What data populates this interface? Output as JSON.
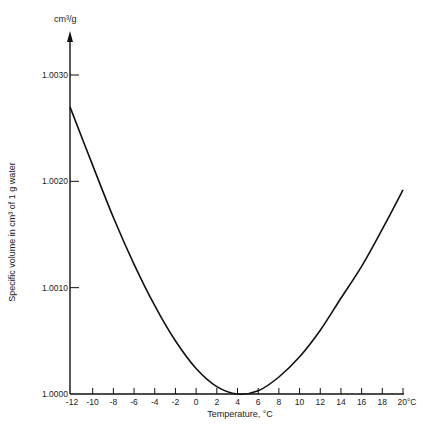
{
  "chart_data": {
    "type": "line",
    "title": "",
    "xlabel": "Temperature, °C",
    "ylabel": "Specific volume in cm³ of 1 g water",
    "y_unit_label": "cm³/g",
    "xlim": [
      -12,
      20
    ],
    "ylim": [
      1.0,
      1.0032
    ],
    "grid": false,
    "legend": null,
    "x_ticks": [
      -12,
      -10,
      -8,
      -6,
      -4,
      -2,
      0,
      2,
      4,
      6,
      8,
      10,
      12,
      14,
      16,
      18,
      20
    ],
    "x_tick_labels": [
      "-12",
      "-10",
      "-8",
      "-6",
      "-4",
      "-2",
      "0",
      "2",
      "4",
      "6",
      "8",
      "10",
      "12",
      "14",
      "16",
      "18",
      "20°C"
    ],
    "y_ticks": [
      1.0,
      1.001,
      1.002,
      1.003
    ],
    "y_tick_labels": [
      "1.0000",
      "1.0010",
      "1.0020",
      "1.0030"
    ],
    "series": [
      {
        "name": "Specific volume of water",
        "x": [
          -12,
          -10,
          -8,
          -6,
          -4,
          -2,
          0,
          2,
          4,
          6,
          8,
          10,
          12,
          14,
          16,
          18,
          20
        ],
        "y": [
          1.0027,
          1.00215,
          1.00166,
          1.00122,
          1.00083,
          1.0005,
          1.00024,
          1.00007,
          1.0,
          1.00003,
          1.00016,
          1.00035,
          1.0006,
          1.0009,
          1.0012,
          1.00155,
          1.00192
        ]
      }
    ]
  }
}
